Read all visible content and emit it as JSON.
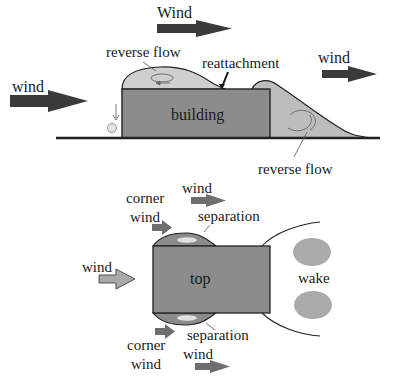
{
  "side_view": {
    "labels": {
      "wind_top": "Wind",
      "wind_left": "wind",
      "wind_right": "wind",
      "reverse_flow_roof": "reverse flow",
      "reattachment": "reattachment",
      "building": "building",
      "reverse_flow_wake": "reverse flow"
    }
  },
  "plan_view": {
    "labels": {
      "corner_top": "corner",
      "corner_wind_top": "wind",
      "wind_top": "wind",
      "separation_top": "separation",
      "wind_left": "wind",
      "top": "top",
      "wake": "wake",
      "separation_bottom": "separation",
      "corner_bottom": "corner",
      "corner_wind_bottom": "wind",
      "wind_bottom": "wind"
    }
  },
  "colors": {
    "building_fill": "#8c8c8c",
    "flow_fill": "#bdbdbd",
    "arrow_dark": "#3a3a3a",
    "arrow_mid": "#6e6e6e",
    "arrow_light": "#a9a9a9",
    "bubble": "#d8d8d8",
    "line": "#222222"
  }
}
